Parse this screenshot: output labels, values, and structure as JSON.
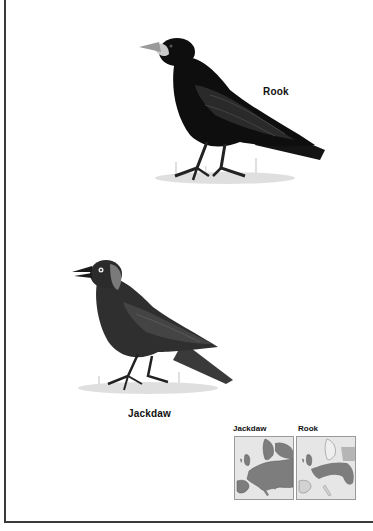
{
  "page": {
    "type": "field guide page"
  },
  "birds": [
    {
      "name": "Rook",
      "label": "Rook",
      "plumage_color": "#111111"
    },
    {
      "name": "Jackdaw",
      "label": "Jackdaw",
      "plumage_color": "#2e2e2e",
      "nape_color": "#7a7a7a"
    }
  ],
  "range_maps": [
    {
      "title": "Jackdaw",
      "land_color": "#e6e6e6",
      "range_color": "#7d7d7d",
      "sea_color": "#f2f2f2"
    },
    {
      "title": "Rook",
      "land_color": "#e6e6e6",
      "range_color": "#7d7d7d",
      "sea_color": "#f2f2f2"
    }
  ]
}
